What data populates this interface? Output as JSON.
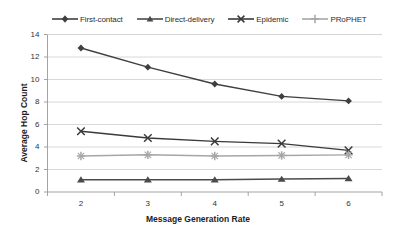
{
  "chart_data": {
    "type": "line",
    "title": "",
    "xlabel": "Message Generation Rate",
    "ylabel": "Average Hop Count",
    "x": [
      2,
      3,
      4,
      5,
      6
    ],
    "xtick_labels": [
      "2",
      "3",
      "4",
      "5",
      "6"
    ],
    "ytick_labels": [
      "0",
      "2",
      "4",
      "6",
      "8",
      "10",
      "12",
      "14"
    ],
    "xlim": [
      1.5,
      6.5
    ],
    "ylim": [
      0,
      14
    ],
    "grid": "horizontal",
    "legend_position": "top",
    "series": [
      {
        "name": "First-contact",
        "marker": "diamond",
        "color": "#3f3f3f",
        "values": [
          12.8,
          11.1,
          9.6,
          8.5,
          8.1
        ]
      },
      {
        "name": "Direct-delivery",
        "marker": "triangle",
        "color": "#4a4a4a",
        "values": [
          1.1,
          1.1,
          1.1,
          1.15,
          1.2
        ]
      },
      {
        "name": "Epidemic",
        "marker": "cross-x",
        "color": "#3a3a3a",
        "values": [
          5.4,
          4.8,
          4.5,
          4.3,
          3.7
        ]
      },
      {
        "name": "PRoPHET",
        "marker": "plus",
        "color": "#a6a6a6",
        "values": [
          3.2,
          3.3,
          3.2,
          3.25,
          3.3
        ]
      }
    ]
  },
  "legend": {
    "items": [
      {
        "label": "First-contact",
        "key": "diamond-marker-icon"
      },
      {
        "label": "Direct-delivery",
        "key": "triangle-marker-icon"
      },
      {
        "label": "Epidemic",
        "key": "x-marker-icon"
      },
      {
        "label": "PRoPHET",
        "key": "plus-marker-icon"
      }
    ]
  },
  "axes": {
    "y_title": "Average Hop Count",
    "x_title": "Message Generation Rate",
    "y_ticks": [
      "14",
      "12",
      "10",
      "8",
      "6",
      "4",
      "2",
      "0"
    ],
    "x_ticks": [
      "2",
      "3",
      "4",
      "5",
      "6"
    ]
  },
  "colors": {
    "plot_border": "#9a9a9a",
    "gridline": "#d4d4d4",
    "dark_series": "#3f3f3f",
    "light_series": "#a6a6a6",
    "text": "#2b2b2b"
  }
}
